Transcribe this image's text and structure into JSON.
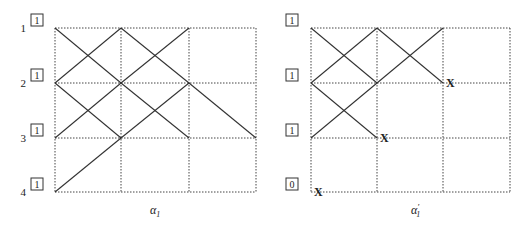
{
  "panels": [
    {
      "id": "left",
      "caption": "α",
      "caption_sub": "1",
      "caption_prime": "",
      "grid": {
        "cols_x": [
          55,
          121,
          189,
          256
        ],
        "rows_y": [
          28,
          83,
          138,
          192
        ]
      },
      "row_labels": [
        "1",
        "2",
        "3",
        "4"
      ],
      "row_label_x": 26,
      "box_x": 37,
      "box_values": [
        "1",
        "1",
        "1",
        "1"
      ],
      "segments": [
        [
          [
            0,
            0
          ],
          [
            1,
            1
          ]
        ],
        [
          [
            1,
            1
          ],
          [
            2,
            2
          ]
        ],
        [
          [
            0,
            1
          ],
          [
            1,
            0
          ]
        ],
        [
          [
            1,
            0
          ],
          [
            2,
            1
          ]
        ],
        [
          [
            2,
            1
          ],
          [
            3,
            2
          ]
        ],
        [
          [
            0,
            2
          ],
          [
            1,
            1
          ]
        ],
        [
          [
            1,
            1
          ],
          [
            2,
            0
          ]
        ],
        [
          [
            0,
            1
          ],
          [
            1,
            2
          ]
        ],
        [
          [
            0,
            3
          ],
          [
            1,
            2
          ]
        ],
        [
          [
            1,
            2
          ],
          [
            2,
            1
          ]
        ]
      ],
      "x_marks": [],
      "caption_x": 150,
      "caption_y": 214
    },
    {
      "id": "right",
      "caption": "α",
      "caption_sub": "1",
      "caption_prime": "′",
      "grid": {
        "cols_x": [
          311,
          377,
          443,
          510
        ],
        "rows_y": [
          28,
          83,
          138,
          192
        ]
      },
      "row_labels": [],
      "row_label_x": 0,
      "box_x": 292,
      "box_values": [
        "1",
        "1",
        "1",
        "0"
      ],
      "segments": [
        [
          [
            0,
            0
          ],
          [
            1,
            1
          ]
        ],
        [
          [
            0,
            1
          ],
          [
            1,
            0
          ]
        ],
        [
          [
            1,
            0
          ],
          [
            2,
            1
          ]
        ],
        [
          [
            0,
            2
          ],
          [
            1,
            1
          ]
        ],
        [
          [
            1,
            1
          ],
          [
            2,
            0
          ]
        ],
        [
          [
            0,
            1
          ],
          [
            1,
            2
          ]
        ]
      ],
      "x_marks": [
        {
          "col": 2,
          "row": 1,
          "label": "X"
        },
        {
          "col": 1,
          "row": 2,
          "label": "X"
        },
        {
          "col": 0,
          "row": 3,
          "label": "X"
        }
      ],
      "caption_x": 411,
      "caption_y": 214
    }
  ]
}
